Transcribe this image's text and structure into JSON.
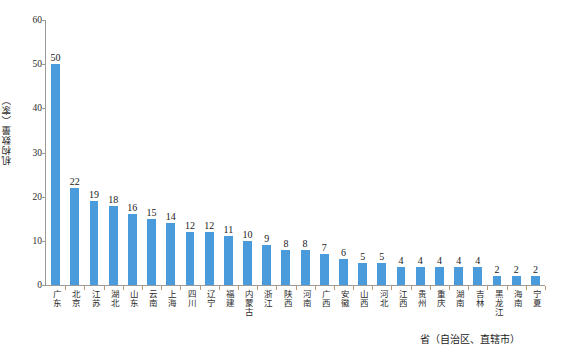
{
  "chart_data": {
    "type": "bar",
    "title": "",
    "subtitle": "",
    "xlabel": "省（自治区、直辖市）",
    "ylabel": "机构数量（家）",
    "ylim": [
      0,
      60
    ],
    "yticks": [
      0,
      10,
      20,
      30,
      40,
      50,
      60
    ],
    "grid": false,
    "legend": "none",
    "bar_color": "#4A9BDB",
    "show_value_labels": true,
    "categories": [
      "广东",
      "北京",
      "江苏",
      "湖北",
      "山东",
      "云南",
      "上海",
      "四川",
      "辽宁",
      "福建",
      "内蒙古",
      "浙江",
      "陕西",
      "河南",
      "广西",
      "安徽",
      "山西",
      "河北",
      "江西",
      "贵州",
      "重庆",
      "湖南",
      "吉林",
      "黑龙江",
      "海南",
      "宁夏"
    ],
    "values": [
      50,
      22,
      19,
      18,
      16,
      15,
      14,
      12,
      12,
      11,
      10,
      9,
      8,
      8,
      7,
      6,
      5,
      5,
      4,
      4,
      4,
      4,
      4,
      2,
      2,
      2
    ]
  },
  "axes": {
    "y_tick_labels": [
      "0",
      "10",
      "20",
      "30",
      "40",
      "50",
      "60"
    ],
    "y_axis_title": "机构数量（家）",
    "x_axis_title": "省（自治区、直辖市）"
  }
}
